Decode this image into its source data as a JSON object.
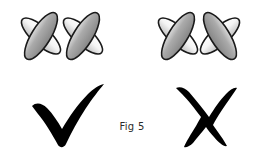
{
  "figure": {
    "caption": "Fig 5",
    "background_color": "#ffffff",
    "outline_color": "#1a1a1a",
    "mark_color": "#000000",
    "groups": [
      {
        "id": "left-group",
        "name": "correct-arrangement",
        "verdict": "correct",
        "verdict_symbol": "checkmark",
        "units": [
          {
            "id": "left-unit-1",
            "center_x": 41,
            "center_y": 36,
            "ellipses": [
              {
                "role": "light-ellipse",
                "rotation_deg": 42,
                "rx": 25,
                "ry": 9,
                "fill_light": "#ffffff",
                "fill_dark": "#c9c9c9"
              },
              {
                "role": "dark-ellipse",
                "rotation_deg": -58,
                "rx": 27,
                "ry": 9.5,
                "fill_light": "#d0d0d0",
                "fill_dark": "#8e8e8e"
              }
            ]
          },
          {
            "id": "left-unit-2",
            "center_x": 83,
            "center_y": 36,
            "ellipses": [
              {
                "role": "light-ellipse",
                "rotation_deg": 42,
                "rx": 25,
                "ry": 9,
                "fill_light": "#ffffff",
                "fill_dark": "#c9c9c9"
              },
              {
                "role": "dark-ellipse",
                "rotation_deg": -58,
                "rx": 27,
                "ry": 9.5,
                "fill_light": "#d0d0d0",
                "fill_dark": "#8e8e8e"
              }
            ]
          }
        ]
      },
      {
        "id": "right-group",
        "name": "incorrect-arrangement",
        "verdict": "incorrect",
        "verdict_symbol": "cross",
        "units": [
          {
            "id": "right-unit-1",
            "center_x": 178,
            "center_y": 36,
            "ellipses": [
              {
                "role": "light-ellipse",
                "rotation_deg": 42,
                "rx": 25,
                "ry": 9,
                "fill_light": "#ffffff",
                "fill_dark": "#c9c9c9"
              },
              {
                "role": "dark-ellipse",
                "rotation_deg": -58,
                "rx": 27,
                "ry": 9.5,
                "fill_light": "#d0d0d0",
                "fill_dark": "#8e8e8e"
              }
            ]
          },
          {
            "id": "right-unit-2",
            "center_x": 220,
            "center_y": 36,
            "mirrored": true,
            "ellipses": [
              {
                "role": "light-ellipse",
                "rotation_deg": -42,
                "rx": 25,
                "ry": 9,
                "fill_light": "#ffffff",
                "fill_dark": "#c9c9c9"
              },
              {
                "role": "dark-ellipse",
                "rotation_deg": 58,
                "rx": 27,
                "ry": 9.5,
                "fill_light": "#d0d0d0",
                "fill_dark": "#8e8e8e"
              }
            ]
          }
        ]
      }
    ],
    "marks": [
      {
        "id": "check-mark",
        "symbol": "checkmark",
        "meaning": "correct",
        "center_x": 68,
        "center_y": 116
      },
      {
        "id": "cross-mark",
        "symbol": "cross",
        "meaning": "incorrect",
        "center_x": 200,
        "center_y": 114
      }
    ]
  }
}
